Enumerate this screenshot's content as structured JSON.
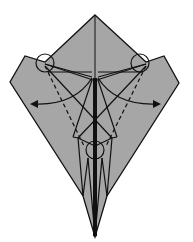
{
  "diagram": {
    "type": "origami-fold-diagram",
    "paper_color": "#a6a6a6",
    "line_color": "#111111",
    "background": "#ffffff",
    "annotations": {
      "circles": 3,
      "arrows": 2,
      "arrow_direction": "outward (left and right)",
      "valley_fold_lines": "dashed"
    }
  }
}
